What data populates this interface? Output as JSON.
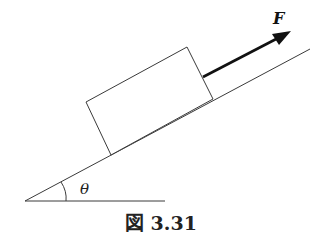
{
  "figure": {
    "caption": "図 3.31",
    "force_label": "F",
    "angle_label": "θ"
  },
  "elements": {
    "incline": "inclined plane line",
    "ground": "horizontal ground line",
    "block": "rectangular block resting on incline",
    "force": "applied force arrow parallel to incline",
    "angle_arc": "arc marking incline angle"
  }
}
